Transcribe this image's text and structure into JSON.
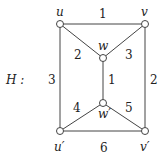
{
  "graph": {
    "name": "H",
    "name_label": "H :",
    "nodes": [
      {
        "id": "u",
        "label": "u",
        "x": 60,
        "y": 24
      },
      {
        "id": "v",
        "label": "v",
        "x": 145,
        "y": 24
      },
      {
        "id": "w",
        "label": "w",
        "x": 103,
        "y": 58
      },
      {
        "id": "w2",
        "label": "w′",
        "x": 103,
        "y": 103
      },
      {
        "id": "u2",
        "label": "u′",
        "x": 60,
        "y": 131
      },
      {
        "id": "v2",
        "label": "v′",
        "x": 145,
        "y": 131
      }
    ],
    "edges": [
      {
        "from": "u",
        "to": "v",
        "weight": "1"
      },
      {
        "from": "u",
        "to": "w",
        "weight": "2"
      },
      {
        "from": "v",
        "to": "w",
        "weight": "3"
      },
      {
        "from": "w",
        "to": "w2",
        "weight": "1"
      },
      {
        "from": "v",
        "to": "v2",
        "weight": "2"
      },
      {
        "from": "u",
        "to": "u2",
        "weight": "3"
      },
      {
        "from": "u2",
        "to": "w2",
        "weight": "4"
      },
      {
        "from": "v2",
        "to": "w2",
        "weight": "5"
      },
      {
        "from": "u2",
        "to": "v2",
        "weight": "6"
      }
    ]
  }
}
